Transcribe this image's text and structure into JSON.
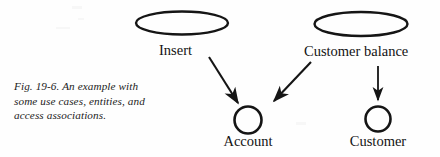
{
  "figure": {
    "caption": "Fig. 19-6. An example with some use cases, entities, and access associations.",
    "background_color": "#fefefe",
    "stroke_color": "#151515"
  },
  "diagram": {
    "type": "use-case-diagram",
    "use_cases": [
      {
        "id": "insert",
        "label": "Insert",
        "shape": "ellipse",
        "cx": 182,
        "cy": 23,
        "rx": 46,
        "ry": 11.5
      },
      {
        "id": "customer-balance",
        "label": "Customer balance",
        "shape": "ellipse",
        "cx": 361,
        "cy": 24,
        "rx": 46.5,
        "ry": 12
      }
    ],
    "entities": [
      {
        "id": "account",
        "label": "Account",
        "shape": "circle",
        "cx": 248,
        "cy": 120,
        "r": 13.5
      },
      {
        "id": "customer",
        "label": "Customer",
        "shape": "circle",
        "cx": 378,
        "cy": 119,
        "r": 12.5
      }
    ],
    "access_associations": [
      {
        "id": "insert-to-account",
        "from": "insert",
        "to": "account",
        "style": "solid-arrow",
        "x1": 209,
        "y1": 57,
        "x2": 239,
        "y2": 104
      },
      {
        "id": "customer-balance-to-account",
        "from": "customer-balance",
        "to": "account",
        "style": "solid-arrow",
        "x1": 311,
        "y1": 62,
        "x2": 272,
        "y2": 103
      },
      {
        "id": "customer-balance-to-customer",
        "from": "customer-balance",
        "to": "customer",
        "style": "solid-arrow",
        "x1": 378,
        "y1": 66,
        "x2": 378,
        "y2": 102
      }
    ]
  }
}
